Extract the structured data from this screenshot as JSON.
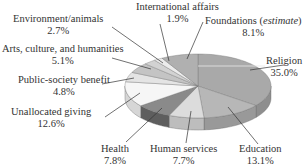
{
  "chart_data": {
    "type": "pie",
    "title": "",
    "style": "3d-exploded-ellipse",
    "start_angle": "12 o'clock",
    "direction": "clockwise",
    "unit": "%",
    "slices": [
      {
        "label": "Religion",
        "value": 35.0,
        "color": "#a9a9a9",
        "side": "#8e8e8e"
      },
      {
        "label": "Education",
        "value": 13.1,
        "color": "#b7b7b7",
        "side": "#999999"
      },
      {
        "label": "Human services",
        "value": 7.7,
        "color": "#dcdcdc",
        "side": "#bdbdbd"
      },
      {
        "label": "Health",
        "value": 7.8,
        "color": "#8a8a8a",
        "side": "#5e5e5e"
      },
      {
        "label": "Unallocated giving",
        "value": 12.6,
        "color": "#f6f6f6",
        "side": "#d6d6d6"
      },
      {
        "label": "Public-society benefit",
        "value": 4.8,
        "color": "#e4e4e4",
        "side": "#c8c8c8"
      },
      {
        "label": "Arts, culture, and humanities",
        "value": 5.1,
        "color": "#c4c4c4",
        "side": "#a8a8a8"
      },
      {
        "label": "Environment/animals",
        "value": 2.7,
        "color": "#d2d2d2",
        "side": "#b4b4b4"
      },
      {
        "label": "International affairs",
        "value": 1.9,
        "color": "#ececec",
        "side": "#cfcfcf"
      },
      {
        "label": "Foundations (estimate)",
        "value": 8.1,
        "color": "#b0b0b0",
        "side": "#949494"
      }
    ]
  },
  "labels": {
    "religion": {
      "name": "Religion",
      "pct": "35.0%"
    },
    "education": {
      "name": "Education",
      "pct": "13.1%"
    },
    "human_services": {
      "name": "Human services",
      "pct": "7.7%"
    },
    "health": {
      "name": "Health",
      "pct": "7.8%"
    },
    "unallocated": {
      "name": "Unallocated giving",
      "pct": "12.6%"
    },
    "public_society": {
      "name": "Public-society benefit",
      "pct": "4.8%"
    },
    "arts": {
      "name": "Arts, culture, and humanities",
      "pct": "5.1%"
    },
    "environment": {
      "name": "Environment/animals",
      "pct": "2.7%"
    },
    "international": {
      "name": "International affairs",
      "pct": "1.9%"
    },
    "foundations": {
      "name": "Foundations",
      "name_note": "estimate",
      "pct": "8.1%"
    }
  }
}
